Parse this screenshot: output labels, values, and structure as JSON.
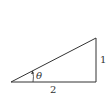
{
  "diagram": {
    "type": "right-triangle",
    "labels": {
      "base": "2",
      "height": "1",
      "angle": "θ"
    },
    "colors": {
      "stroke": "#333333",
      "text": "#333333",
      "background": "#ffffff"
    }
  }
}
